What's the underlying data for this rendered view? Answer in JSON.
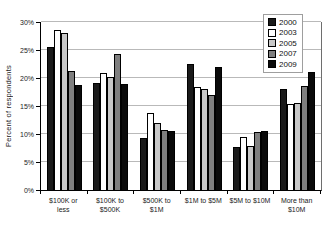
{
  "chart_data": {
    "type": "bar",
    "title": "",
    "xlabel": "",
    "ylabel": "Percent of respondents",
    "ylim": [
      0,
      30
    ],
    "ytick_step": 5,
    "ytick_suffix": "%",
    "grid": true,
    "legend_position": "top-right",
    "categories": [
      "$100K or less",
      "$100K to $500K",
      "$500K to $1M",
      "$1M to $5M",
      "$5M to $10M",
      "More than $10M"
    ],
    "series": [
      {
        "name": "2000",
        "color": "#1a1a1a",
        "values": [
          25.5,
          19.1,
          9.3,
          22.5,
          7.6,
          18.0
        ]
      },
      {
        "name": "2003",
        "color": "#ffffff",
        "values": [
          28.5,
          20.9,
          13.8,
          18.4,
          9.4,
          15.3
        ]
      },
      {
        "name": "2005",
        "color": "#c8c8c8",
        "values": [
          28.0,
          20.2,
          11.9,
          18.0,
          7.9,
          15.6
        ]
      },
      {
        "name": "2007",
        "color": "#7f7f7f",
        "values": [
          21.3,
          24.2,
          10.8,
          16.9,
          10.3,
          18.6
        ]
      },
      {
        "name": "2009",
        "color": "#0a0a0a",
        "values": [
          18.7,
          19.0,
          10.5,
          21.9,
          10.5,
          21.0
        ]
      }
    ],
    "colors": {
      "background": "#ffffff",
      "gridline": "#b9b9b9",
      "axis": "#000000",
      "bar_border": "#000000",
      "legend_border": "#9e9e9e"
    }
  }
}
